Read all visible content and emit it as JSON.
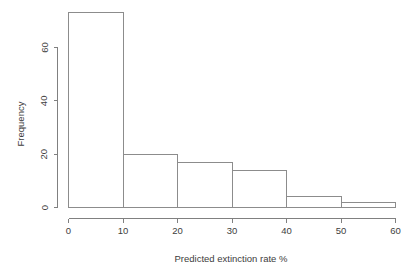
{
  "chart_data": {
    "type": "bar",
    "subtype": "histogram",
    "title": "",
    "xlabel": "Predicted extinction rate %",
    "ylabel": "Frequency",
    "categories": [
      "0-10",
      "10-20",
      "20-30",
      "30-40",
      "40-50",
      "50-60"
    ],
    "bin_edges": [
      0,
      10,
      20,
      30,
      40,
      50,
      60
    ],
    "values": [
      73,
      20,
      17,
      14,
      4,
      2
    ],
    "xlim": [
      0,
      60
    ],
    "ylim": [
      0,
      73
    ],
    "x_ticks": [
      0,
      10,
      20,
      30,
      40,
      50,
      60
    ],
    "x_tick_labels": [
      "0",
      "10",
      "20",
      "30",
      "40",
      "50",
      "60"
    ],
    "y_ticks": [
      0,
      20,
      40,
      60
    ],
    "y_tick_labels": [
      "0",
      "20",
      "40",
      "60"
    ],
    "grid": false,
    "legend": false,
    "bar_fill_color": "#ffffff",
    "bar_border_color": "#8c8c8c",
    "axis_color": "#808080",
    "text_color": "#3d3d3d",
    "background_color": "#ffffff"
  }
}
